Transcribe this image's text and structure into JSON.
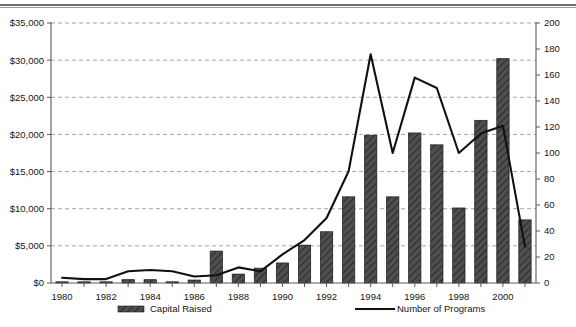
{
  "chart_data": {
    "type": "bar",
    "title": "",
    "subtitle": "",
    "xlabel": "",
    "ylabel": "",
    "x": [
      1980,
      1981,
      1982,
      1983,
      1984,
      1985,
      1986,
      1987,
      1988,
      1989,
      1990,
      1991,
      1992,
      1993,
      1994,
      1995,
      1996,
      1997,
      1998,
      1999,
      2000,
      2001
    ],
    "categories": [
      "1980",
      "1981",
      "1982",
      "1983",
      "1984",
      "1985",
      "1986",
      "1987",
      "1988",
      "1989",
      "1990",
      "1991",
      "1992",
      "1993",
      "1994",
      "1995",
      "1996",
      "1997",
      "1998",
      "1999",
      "2000",
      "2001"
    ],
    "xtick_labels": [
      "1980",
      "1982",
      "1984",
      "1986",
      "1988",
      "1990",
      "1992",
      "1994",
      "1996",
      "1998",
      "2000"
    ],
    "xtick_values": [
      1980,
      1982,
      1984,
      1986,
      1988,
      1990,
      1992,
      1994,
      1996,
      1998,
      2000
    ],
    "xlim": [
      1979.5,
      2001.5
    ],
    "grid": true,
    "legend_position": "bottom",
    "series": [
      {
        "name": "Capital Raised",
        "type": "bar",
        "axis": "left",
        "color": "#4a4a4a",
        "hatch": "diagonal",
        "values": [
          100,
          100,
          100,
          450,
          450,
          100,
          400,
          4300,
          1200,
          2000,
          2700,
          5100,
          6900,
          11600,
          19900,
          11600,
          20200,
          18600,
          10100,
          21900,
          30200,
          8500
        ]
      },
      {
        "name": "Number of Programs",
        "type": "line",
        "axis": "right",
        "color": "#111111",
        "values": [
          4,
          3,
          3,
          9,
          10,
          9,
          5,
          6,
          12,
          9,
          22,
          33,
          50,
          86,
          176,
          100,
          158,
          150,
          100,
          115,
          121,
          28
        ]
      }
    ],
    "left_axis": {
      "title": "",
      "ylim": [
        0,
        35000
      ],
      "tick_step": 5000,
      "tick_labels": [
        "$0",
        "$5,000",
        "$10,000",
        "$15,000",
        "$20,000",
        "$25,000",
        "$30,000",
        "$35,000"
      ],
      "tick_values": [
        0,
        5000,
        10000,
        15000,
        20000,
        25000,
        30000,
        35000
      ],
      "prefix": "$"
    },
    "right_axis": {
      "title": "",
      "ylim": [
        0,
        200
      ],
      "tick_step": 20,
      "tick_labels": [
        "0",
        "20",
        "40",
        "60",
        "80",
        "100",
        "120",
        "140",
        "160",
        "180",
        "200"
      ],
      "tick_values": [
        0,
        20,
        40,
        60,
        80,
        100,
        120,
        140,
        160,
        180,
        200
      ]
    },
    "legend": [
      {
        "label": "Capital Raised",
        "marker": "bar-swatch",
        "color": "#4a4a4a"
      },
      {
        "label": "Number of Programs",
        "marker": "line-swatch",
        "color": "#111111"
      }
    ]
  },
  "colors": {
    "bar_fill": "#4a4a4a",
    "bar_edge": "#1b1b1b",
    "line": "#111111",
    "grid": "#8e8e8e",
    "axis": "#5a5a5a",
    "text": "#16161a",
    "background": "#ffffff"
  }
}
